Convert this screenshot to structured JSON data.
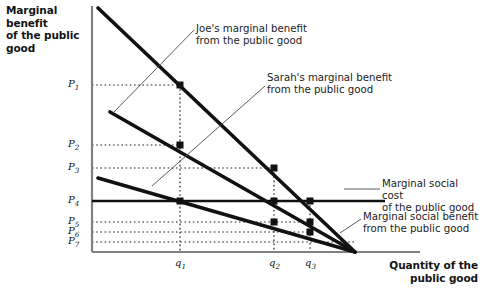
{
  "figure": {
    "background": "#ffffff",
    "line_color": "#111111",
    "axis_color": "#6f6f6f",
    "dotted_color": "#2b2b2b"
  },
  "axes": {
    "y_title": "Marginal benefit\nof the public good",
    "x_title": "Quantity of the\npublic good",
    "y_ticks": [
      {
        "label": "P",
        "sub": "1",
        "y": 85
      },
      {
        "label": "P",
        "sub": "2",
        "y": 145
      },
      {
        "label": "P",
        "sub": "3",
        "y": 168
      },
      {
        "label": "P",
        "sub": "4",
        "y": 201
      },
      {
        "label": "P",
        "sub": "5",
        "y": 222
      },
      {
        "label": "P",
        "sub": "6",
        "y": 232
      },
      {
        "label": "P",
        "sub": "7",
        "y": 242
      }
    ],
    "x_ticks": [
      {
        "label": "q",
        "sub": "1",
        "x": 180
      },
      {
        "label": "q",
        "sub": "2",
        "x": 274
      },
      {
        "label": "q",
        "sub": "3",
        "x": 310
      }
    ],
    "origin": {
      "x": 92,
      "y": 252
    },
    "x_axis_end": 420,
    "y_axis_top": 6
  },
  "annotations": {
    "joe": "Joe's marginal benefit\nfrom the public good",
    "sarah": "Sarah's marginal benefit\nfrom the public good",
    "msc": "Marginal social cost\nof the public good",
    "msb": "Marginal social benefit\nfrom the public good"
  },
  "chart_data": {
    "type": "line",
    "title": "",
    "xlabel": "Quantity of the public good",
    "ylabel": "Marginal benefit of the public good",
    "xlim": [
      0,
      482
    ],
    "ylim": [
      0,
      290
    ],
    "grid": false,
    "legend": "inline-annotations",
    "x_tick_labels": [
      "q1",
      "q2",
      "q3"
    ],
    "y_tick_labels": [
      "P1",
      "P2",
      "P3",
      "P4",
      "P5",
      "P6",
      "P7"
    ],
    "series": [
      {
        "name": "Marginal social benefit from the public good",
        "type": "line",
        "points_px": [
          [
            98,
            8
          ],
          [
            355,
            252
          ]
        ],
        "markers_px": [
          [
            180,
            85
          ],
          [
            274,
            168
          ],
          [
            310,
            201
          ]
        ],
        "marker_labels": [
          "(q1, P1)",
          "(q2, P3)",
          "(q3, P4)"
        ]
      },
      {
        "name": "Joe's marginal benefit from the public good",
        "type": "line",
        "points_px": [
          [
            110,
            112
          ],
          [
            355,
            252
          ]
        ],
        "markers_px": [
          [
            180,
            145
          ],
          [
            310,
            222
          ]
        ],
        "marker_labels": [
          "(q1, P2)",
          "(q3, P5)"
        ]
      },
      {
        "name": "Sarah's marginal benefit from the public good",
        "type": "line",
        "points_px": [
          [
            98,
            178
          ],
          [
            355,
            252
          ]
        ],
        "markers_px": [
          [
            274,
            222
          ],
          [
            310,
            232
          ]
        ],
        "marker_labels": [
          "(q2, P5)",
          "(q3, P6)"
        ]
      },
      {
        "name": "Marginal social cost of the public good",
        "type": "line",
        "points_px": [
          [
            92,
            201
          ],
          [
            385,
            201
          ]
        ],
        "markers_px": [
          [
            180,
            201
          ],
          [
            274,
            201
          ]
        ],
        "marker_labels": [
          "(q1, P4)",
          "(q2, P4)"
        ]
      }
    ],
    "equilibrium_note": "Efficient quantity where marginal social benefit equals marginal social cost at q3, P4",
    "convergence_point_px": [
      355,
      252
    ]
  }
}
